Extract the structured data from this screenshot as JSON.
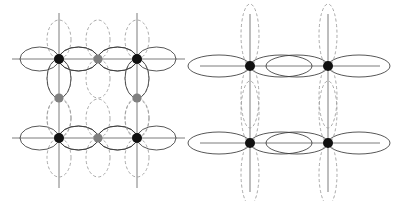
{
  "figure": {
    "title": "",
    "width": 394,
    "height": 201,
    "background": "#ffffff"
  },
  "colors": {
    "background": "#ffffff",
    "atom_primary": "#111111",
    "atom_secondary": "#808080",
    "lobe_solid": "#3a3a3a",
    "lobe_dashed": "#9a9a9a",
    "axis_line": "#5a5a5a"
  },
  "style": {
    "lobe_stroke_width": 0.85,
    "axis_stroke_width": 0.8,
    "dash_pattern": "3,2.4",
    "atom_radius_primary": 5.0,
    "atom_radius_secondary": 4.6
  },
  "panels": [
    {
      "id": "panel-left",
      "name": "left-panel",
      "label": "",
      "origin_x": 0,
      "origin_y": 0,
      "lattice": {
        "x_positions": [
          59,
          98,
          137
        ],
        "y_positions": [
          59,
          98,
          138
        ],
        "axis_extent": {
          "x_min": 12,
          "x_max": 185,
          "y_min": 13,
          "y_max": 188
        }
      },
      "lobe_geometry": {
        "horizontal": {
          "rx": 19.5,
          "ry": 12.0
        },
        "vertical": {
          "rx": 12.0,
          "ry": 19.5
        }
      },
      "atoms": [
        {
          "id": "L-a1",
          "name": "corner-atom-top-left",
          "cx": 59,
          "cy": 59,
          "color_key": "atom_primary",
          "radius_key": "atom_radius_primary"
        },
        {
          "id": "L-a2",
          "name": "corner-atom-top-right",
          "cx": 137,
          "cy": 59,
          "color_key": "atom_primary",
          "radius_key": "atom_radius_primary"
        },
        {
          "id": "L-a3",
          "name": "corner-atom-bottom-left",
          "cx": 59,
          "cy": 138,
          "color_key": "atom_primary",
          "radius_key": "atom_radius_primary"
        },
        {
          "id": "L-a4",
          "name": "corner-atom-bottom-right",
          "cx": 137,
          "cy": 138,
          "color_key": "atom_primary",
          "radius_key": "atom_radius_primary"
        },
        {
          "id": "L-b1",
          "name": "edge-atom-top-middle",
          "cx": 98,
          "cy": 59,
          "color_key": "atom_secondary",
          "radius_key": "atom_radius_secondary"
        },
        {
          "id": "L-b2",
          "name": "edge-atom-bottom-middle",
          "cx": 98,
          "cy": 138,
          "color_key": "atom_secondary",
          "radius_key": "atom_radius_secondary"
        },
        {
          "id": "L-b3",
          "name": "edge-atom-left-middle",
          "cx": 59,
          "cy": 98,
          "color_key": "atom_secondary",
          "radius_key": "atom_radius_secondary"
        },
        {
          "id": "L-b4",
          "name": "edge-atom-right-middle",
          "cx": 137,
          "cy": 98,
          "color_key": "atom_secondary",
          "radius_key": "atom_radius_secondary"
        }
      ],
      "axes": [
        {
          "name": "axis-horizontal-top",
          "orientation": "h",
          "pos": 59,
          "from": 12,
          "to": 185
        },
        {
          "name": "axis-horizontal-bottom",
          "orientation": "h",
          "pos": 138,
          "from": 12,
          "to": 185
        },
        {
          "name": "axis-vertical-left",
          "orientation": "v",
          "pos": 59,
          "from": 13,
          "to": 188
        },
        {
          "name": "axis-vertical-right",
          "orientation": "v",
          "pos": 137,
          "from": 13,
          "to": 188
        }
      ],
      "lobes": [
        {
          "name": "lobe-h-solid",
          "at": "L-a1",
          "dir": "left",
          "style": "solid"
        },
        {
          "name": "lobe-h-solid",
          "at": "L-a1",
          "dir": "right",
          "style": "solid"
        },
        {
          "name": "lobe-v-dashed",
          "at": "L-a1",
          "dir": "up",
          "style": "dashed"
        },
        {
          "name": "lobe-v-dashed",
          "at": "L-a1",
          "dir": "down",
          "style": "dashed"
        },
        {
          "name": "lobe-h-solid",
          "at": "L-a2",
          "dir": "left",
          "style": "solid"
        },
        {
          "name": "lobe-h-solid",
          "at": "L-a2",
          "dir": "right",
          "style": "solid"
        },
        {
          "name": "lobe-v-dashed",
          "at": "L-a2",
          "dir": "up",
          "style": "dashed"
        },
        {
          "name": "lobe-v-dashed",
          "at": "L-a2",
          "dir": "down",
          "style": "dashed"
        },
        {
          "name": "lobe-h-solid",
          "at": "L-a3",
          "dir": "left",
          "style": "solid"
        },
        {
          "name": "lobe-h-solid",
          "at": "L-a3",
          "dir": "right",
          "style": "solid"
        },
        {
          "name": "lobe-v-dashed",
          "at": "L-a3",
          "dir": "up",
          "style": "dashed"
        },
        {
          "name": "lobe-v-dashed",
          "at": "L-a3",
          "dir": "down",
          "style": "dashed"
        },
        {
          "name": "lobe-h-solid",
          "at": "L-a4",
          "dir": "left",
          "style": "solid"
        },
        {
          "name": "lobe-h-solid",
          "at": "L-a4",
          "dir": "right",
          "style": "solid"
        },
        {
          "name": "lobe-v-dashed",
          "at": "L-a4",
          "dir": "up",
          "style": "dashed"
        },
        {
          "name": "lobe-v-dashed",
          "at": "L-a4",
          "dir": "down",
          "style": "dashed"
        },
        {
          "name": "lobe-h-solid",
          "at": "L-b1",
          "dir": "left",
          "style": "solid"
        },
        {
          "name": "lobe-h-solid",
          "at": "L-b1",
          "dir": "right",
          "style": "solid"
        },
        {
          "name": "lobe-v-dashed",
          "at": "L-b1",
          "dir": "up",
          "style": "dashed"
        },
        {
          "name": "lobe-v-dashed",
          "at": "L-b1",
          "dir": "down",
          "style": "dashed"
        },
        {
          "name": "lobe-h-solid",
          "at": "L-b2",
          "dir": "left",
          "style": "solid"
        },
        {
          "name": "lobe-h-solid",
          "at": "L-b2",
          "dir": "right",
          "style": "solid"
        },
        {
          "name": "lobe-v-dashed",
          "at": "L-b2",
          "dir": "up",
          "style": "dashed"
        },
        {
          "name": "lobe-v-dashed",
          "at": "L-b2",
          "dir": "down",
          "style": "dashed"
        },
        {
          "name": "lobe-v-solid",
          "at": "L-b3",
          "dir": "up",
          "style": "solid"
        },
        {
          "name": "lobe-v-dashed",
          "at": "L-b3",
          "dir": "down",
          "style": "dashed"
        },
        {
          "name": "lobe-v-solid",
          "at": "L-b4",
          "dir": "up",
          "style": "solid"
        },
        {
          "name": "lobe-v-dashed",
          "at": "L-b4",
          "dir": "down",
          "style": "dashed"
        }
      ]
    },
    {
      "id": "panel-right",
      "name": "right-panel",
      "label": "",
      "origin_x": 197,
      "origin_y": 0,
      "lattice": {
        "x_positions": [
          250,
          328
        ],
        "y_positions": [
          66,
          143
        ],
        "axis_extent": {
          "x_min": 200,
          "x_max": 380,
          "y_min": 14,
          "y_max": 192
        }
      },
      "lobe_geometry": {
        "horizontal": {
          "rx": 31.0,
          "ry": 11.0
        },
        "vertical": {
          "rx": 9.0,
          "ry": 31.0
        }
      },
      "atoms": [
        {
          "id": "R-a1",
          "name": "corner-atom-top-left",
          "cx": 250,
          "cy": 66,
          "color_key": "atom_primary",
          "radius_key": "atom_radius_primary"
        },
        {
          "id": "R-a2",
          "name": "corner-atom-top-right",
          "cx": 328,
          "cy": 66,
          "color_key": "atom_primary",
          "radius_key": "atom_radius_primary"
        },
        {
          "id": "R-a3",
          "name": "corner-atom-bottom-left",
          "cx": 250,
          "cy": 143,
          "color_key": "atom_primary",
          "radius_key": "atom_radius_primary"
        },
        {
          "id": "R-a4",
          "name": "corner-atom-bottom-right",
          "cx": 328,
          "cy": 143,
          "color_key": "atom_primary",
          "radius_key": "atom_radius_primary"
        }
      ],
      "axes": [
        {
          "name": "axis-horizontal-top",
          "orientation": "h",
          "pos": 66,
          "from": 200,
          "to": 380
        },
        {
          "name": "axis-horizontal-bottom",
          "orientation": "h",
          "pos": 143,
          "from": 200,
          "to": 380
        },
        {
          "name": "axis-vertical-left",
          "orientation": "v",
          "pos": 250,
          "from": 14,
          "to": 192
        },
        {
          "name": "axis-vertical-right",
          "orientation": "v",
          "pos": 328,
          "from": 14,
          "to": 192
        }
      ],
      "lobes": [
        {
          "name": "lobe-h-solid",
          "at": "R-a1",
          "dir": "left",
          "style": "solid"
        },
        {
          "name": "lobe-h-solid",
          "at": "R-a1",
          "dir": "right",
          "style": "solid"
        },
        {
          "name": "lobe-v-dashed",
          "at": "R-a1",
          "dir": "up",
          "style": "dashed"
        },
        {
          "name": "lobe-v-dashed",
          "at": "R-a1",
          "dir": "down",
          "style": "dashed"
        },
        {
          "name": "lobe-h-solid",
          "at": "R-a2",
          "dir": "left",
          "style": "solid"
        },
        {
          "name": "lobe-h-solid",
          "at": "R-a2",
          "dir": "right",
          "style": "solid"
        },
        {
          "name": "lobe-v-dashed",
          "at": "R-a2",
          "dir": "up",
          "style": "dashed"
        },
        {
          "name": "lobe-v-dashed",
          "at": "R-a2",
          "dir": "down",
          "style": "dashed"
        },
        {
          "name": "lobe-h-solid",
          "at": "R-a3",
          "dir": "left",
          "style": "solid"
        },
        {
          "name": "lobe-h-solid",
          "at": "R-a3",
          "dir": "right",
          "style": "solid"
        },
        {
          "name": "lobe-v-dashed",
          "at": "R-a3",
          "dir": "up",
          "style": "dashed"
        },
        {
          "name": "lobe-v-dashed",
          "at": "R-a3",
          "dir": "down",
          "style": "dashed"
        },
        {
          "name": "lobe-h-solid",
          "at": "R-a4",
          "dir": "left",
          "style": "solid"
        },
        {
          "name": "lobe-h-solid",
          "at": "R-a4",
          "dir": "right",
          "style": "solid"
        },
        {
          "name": "lobe-v-dashed",
          "at": "R-a4",
          "dir": "up",
          "style": "dashed"
        },
        {
          "name": "lobe-v-dashed",
          "at": "R-a4",
          "dir": "down",
          "style": "dashed"
        }
      ]
    }
  ]
}
